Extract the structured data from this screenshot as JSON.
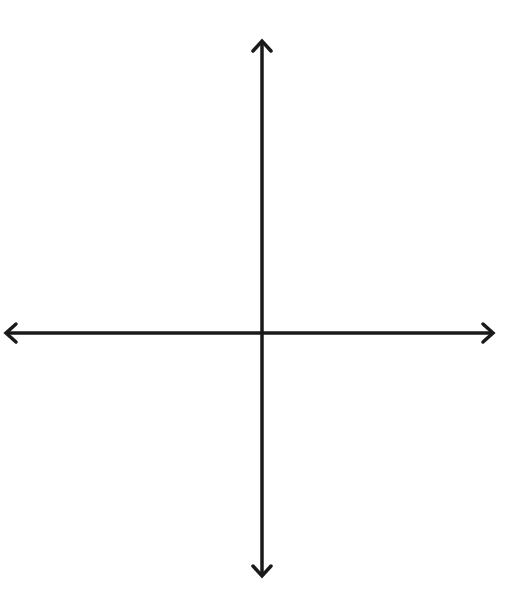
{
  "diagram": {
    "x_axis_label": "x",
    "y_axis_label": "y",
    "x_ticks": [
      "-4",
      "-3",
      "-2",
      "-1",
      "0",
      "1",
      "2",
      "3",
      "4"
    ],
    "x_tick_values": [
      -4,
      -3,
      -2,
      -1,
      0,
      1,
      2,
      3,
      4
    ],
    "y_ticks": [
      "5",
      "4",
      "3",
      "2",
      "1",
      "-1",
      "-2",
      "-3",
      "-4"
    ],
    "y_tick_values": [
      5,
      4,
      3,
      2,
      1,
      -1,
      -2,
      -3,
      -4
    ],
    "grid_range": {
      "x": [
        -5,
        5
      ],
      "y": [
        -5,
        6
      ]
    },
    "colors": {
      "grid": "#bdbdbd",
      "axis": "#1a1a1a",
      "label": "#333333"
    }
  }
}
